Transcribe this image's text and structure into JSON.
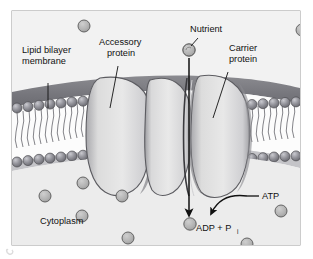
{
  "figure": {
    "type": "biology-diagram",
    "background_color": "#ffffff",
    "panel_background_color": "#efefef",
    "panel_border_color": "#9a9a9a",
    "membrane_top_band_color": "#7d7d82",
    "membrane_interior_color": "#fbfbfb",
    "phospholipid_head_color": "#8e8e95",
    "protein_fill_color": "#e2e2e2",
    "protein_shade_color": "#9b9b9f",
    "particle_fill_color": "#b5b5b5",
    "particle_stroke_color": "#585858",
    "line_color": "#111111"
  },
  "labels": {
    "lipid_bilayer": {
      "line1": "Lipid bilayer",
      "line2": "membrane"
    },
    "accessory_protein": {
      "line1": "Accessory",
      "line2": "protein"
    },
    "nutrient": "Nutrient",
    "carrier_protein": {
      "line1": "Carrier",
      "line2": "protein"
    },
    "atp": "ATP",
    "adp": "ADP + P",
    "adp_subscript": "i",
    "cytoplasm": "Cytoplasm"
  },
  "caption": {
    "text": ""
  }
}
